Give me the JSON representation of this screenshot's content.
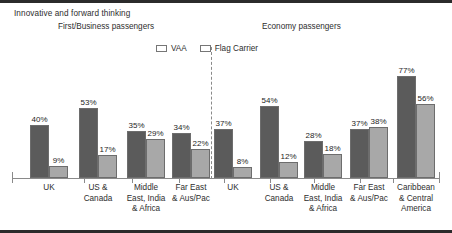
{
  "slide": {
    "title": "Innovative and forward thinking"
  },
  "panels": [
    {
      "title": "First/Business passengers"
    },
    {
      "title": "Economy passengers"
    }
  ],
  "legend": {
    "position": "top-center",
    "entries": [
      {
        "label": "VAA",
        "color": "#5b5b5b",
        "icon": "legend-swatch"
      },
      {
        "label": "Flag Carrier",
        "color": "#a8a8a8",
        "icon": "legend-swatch"
      }
    ]
  },
  "chart_data": {
    "type": "bar",
    "title": "Innovative and forward thinking",
    "subtitle": "",
    "xlabel": "",
    "ylabel": "",
    "ylim": [
      0,
      100
    ],
    "grid": false,
    "legend_position": "top-center",
    "value_suffix": "%",
    "panels": [
      {
        "name": "First/Business passengers",
        "categories": [
          "UK",
          "US &\nCanada",
          "Middle\nEast, India\n& Africa",
          "Far East\n& Aus/Pac"
        ],
        "series": [
          {
            "name": "VAA",
            "color": "#5b5b5b",
            "values": [
              40,
              53,
              35,
              34
            ]
          },
          {
            "name": "Flag Carrier",
            "color": "#a8a8a8",
            "values": [
              9,
              17,
              29,
              22
            ]
          }
        ]
      },
      {
        "name": "Economy passengers",
        "categories": [
          "UK",
          "US &\nCanada",
          "Middle\nEast, India\n& Africa",
          "Far East\n& Aus/Pac",
          "Caribbean\n& Central\nAmerica"
        ],
        "series": [
          {
            "name": "VAA",
            "color": "#5b5b5b",
            "values": [
              37,
              54,
              28,
              37,
              77
            ]
          },
          {
            "name": "Flag Carrier",
            "color": "#a8a8a8",
            "values": [
              8,
              12,
              18,
              38,
              56
            ]
          }
        ]
      }
    ]
  },
  "categories_left": [
    {
      "lines": [
        "UK"
      ],
      "x": 49
    },
    {
      "lines": [
        "US &",
        "Canada"
      ],
      "x": 98
    },
    {
      "lines": [
        "Middle",
        "East, India",
        "& Africa"
      ],
      "x": 146
    },
    {
      "lines": [
        "Far East",
        "& Aus/Pac"
      ],
      "x": 191
    }
  ],
  "categories_right": [
    {
      "lines": [
        "UK"
      ],
      "x": 233
    },
    {
      "lines": [
        "US &",
        "Canada"
      ],
      "x": 279
    },
    {
      "lines": [
        "Middle",
        "East, India",
        "& Africa"
      ],
      "x": 323
    },
    {
      "lines": [
        "Far East",
        "& Aus/Pac"
      ],
      "x": 369
    },
    {
      "lines": [
        "Caribbean",
        "& Central",
        "America"
      ],
      "x": 416
    }
  ],
  "group_geometry": {
    "left": [
      {
        "x": 26,
        "width": 46
      },
      {
        "x": 75,
        "width": 46
      },
      {
        "x": 123,
        "width": 46
      },
      {
        "x": 168,
        "width": 46
      }
    ],
    "right": [
      {
        "x": 210,
        "width": 46
      },
      {
        "x": 256,
        "width": 46
      },
      {
        "x": 300,
        "width": 46
      },
      {
        "x": 346,
        "width": 46
      },
      {
        "x": 393,
        "width": 46
      }
    ]
  },
  "ticks_x": [
    12,
    84,
    132,
    179,
    224,
    270,
    314,
    360,
    393,
    439
  ]
}
